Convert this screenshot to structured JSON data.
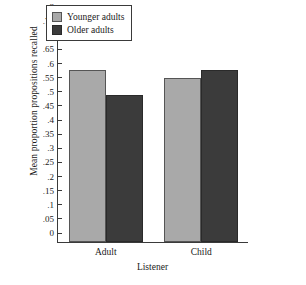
{
  "chart_data": {
    "type": "bar",
    "title": "",
    "xlabel": "Listener",
    "ylabel": "Mean proportion propositions recalled",
    "categories": [
      "Adult",
      "Child"
    ],
    "series": [
      {
        "name": "Younger adults",
        "values": [
          0.61,
          0.58
        ],
        "color": "#a9a9a9"
      },
      {
        "name": "Older adults",
        "values": [
          0.52,
          0.61
        ],
        "color": "#3b3b3b"
      }
    ],
    "ylim": [
      0,
      0.8
    ],
    "ytick_values": [
      0.8,
      0.75,
      0.7,
      0.65,
      0.6,
      0.55,
      0.5,
      0.45,
      0.4,
      0.35,
      0.3,
      0.25,
      0.2,
      0.15,
      0.1,
      0.05,
      0
    ],
    "ytick_labels": [
      ".8",
      ".75",
      ".7",
      ".65",
      ".6",
      ".55",
      ".5",
      ".45",
      ".4",
      ".35",
      ".3",
      ".25",
      ".2",
      ".15",
      ".1",
      ".05",
      "0"
    ],
    "grid": false,
    "legend_position": "top-center"
  },
  "legend": {
    "entries": [
      {
        "label": "Younger adults"
      },
      {
        "label": "Older adults"
      }
    ]
  }
}
